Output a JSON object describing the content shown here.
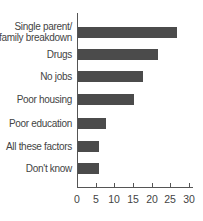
{
  "chart_data": {
    "type": "bar",
    "orientation": "horizontal",
    "title": "",
    "xlabel": "",
    "ylabel": "",
    "categories": [
      "Single parent/ family breakdown",
      "Drugs",
      "No jobs",
      "Poor housing",
      "Poor education",
      "All these factors",
      "Don't know"
    ],
    "values": [
      26.5,
      21.5,
      17.5,
      15,
      7.5,
      5.5,
      5.5
    ],
    "xlim": [
      0,
      30
    ],
    "xticks": [
      0,
      5,
      10,
      15,
      20,
      25,
      30
    ],
    "grid": false,
    "legend": null,
    "bar_color": "#4b4b4b"
  },
  "labels": {
    "cat0_line1": "Single parent/",
    "cat0_line2": "family breakdown",
    "cat1": "Drugs",
    "cat2": "No jobs",
    "cat3": "Poor housing",
    "cat4": "Poor education",
    "cat5": "All these factors",
    "cat6": "Don't know"
  },
  "ticks": [
    "0",
    "5",
    "10",
    "15",
    "20",
    "25",
    "30"
  ]
}
